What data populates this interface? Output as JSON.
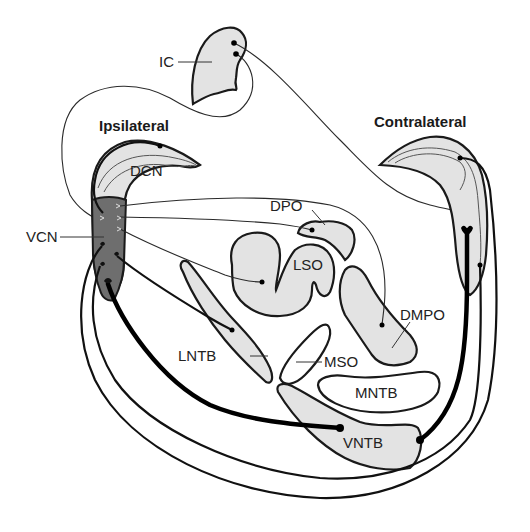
{
  "diagram": {
    "type": "auditory brainstem circuit diagram",
    "side_labels": {
      "ipsilateral": "Ipsilateral",
      "contralateral": "Contralateral"
    },
    "nuclei": {
      "ic": "IC",
      "dcn": "DCN",
      "vcn": "VCN",
      "dpo": "DPO",
      "lso": "LSO",
      "dmpo": "DMPO",
      "lntb": "LNTB",
      "mso": "MSO",
      "mntb": "MNTB",
      "vntb": "VNTB"
    },
    "colors": {
      "nucleus_fill": "#e3e3e3",
      "vcn_fill": "#6e6e6e",
      "stroke": "#1a1a1a",
      "background": "#ffffff"
    }
  }
}
